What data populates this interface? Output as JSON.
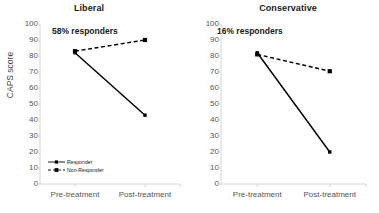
{
  "figure": {
    "y_axis_label": "CAPS score"
  },
  "legend": {
    "responder_label": "Responder",
    "non_responder_label": "Non-Responder"
  },
  "chart_data": [
    {
      "type": "line",
      "title": "Liberal",
      "annotation": "58% responders",
      "xlabel": "",
      "ylabel": "CAPS score",
      "categories": [
        "Pre-treatment",
        "Post-treatment"
      ],
      "ylim": [
        0,
        100
      ],
      "yticks": [
        100,
        90,
        80,
        70,
        60,
        50,
        40,
        30,
        20,
        10,
        0
      ],
      "grid": false,
      "legend_position": "bottom-left",
      "series": [
        {
          "name": "Responder",
          "values": [
            82,
            43
          ],
          "style": "solid",
          "marker": "square",
          "color": "#000000"
        },
        {
          "name": "Non-Responder",
          "values": [
            83,
            90
          ],
          "style": "dashed",
          "marker": "square",
          "color": "#000000"
        }
      ]
    },
    {
      "type": "line",
      "title": "Conservative",
      "annotation": "16% responders",
      "xlabel": "",
      "ylabel": "",
      "categories": [
        "Pre-treatment",
        "Post-treatment"
      ],
      "ylim": [
        0,
        100
      ],
      "yticks": [
        100,
        90,
        80,
        70,
        60,
        50,
        40,
        30,
        20,
        10,
        0
      ],
      "grid": false,
      "legend_position": "none",
      "series": [
        {
          "name": "Responder",
          "values": [
            82,
            20
          ],
          "style": "solid",
          "marker": "square",
          "color": "#000000"
        },
        {
          "name": "Non-Responder",
          "values": [
            81,
            70.5
          ],
          "style": "dashed",
          "marker": "square",
          "color": "#000000"
        }
      ]
    }
  ]
}
